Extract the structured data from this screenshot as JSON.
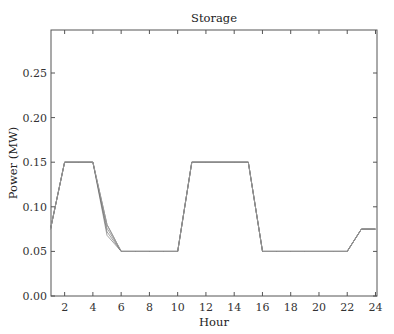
{
  "chart_data": {
    "type": "line",
    "title": "Storage",
    "xlabel": "Hour",
    "ylabel": "Power (MW)",
    "xlim": [
      1,
      24
    ],
    "ylim": [
      0,
      0.3
    ],
    "xticks": [
      2,
      4,
      6,
      8,
      10,
      12,
      14,
      16,
      18,
      20,
      22,
      24
    ],
    "yticks": [
      0.0,
      0.05,
      0.1,
      0.15,
      0.2,
      0.25
    ],
    "ytick_labels": [
      "0.00",
      "0.05",
      "0.10",
      "0.15",
      "0.20",
      "0.25"
    ],
    "grid": false,
    "legend": null,
    "x": [
      1,
      2,
      3,
      4,
      5,
      6,
      7,
      8,
      9,
      10,
      11,
      12,
      13,
      14,
      15,
      16,
      17,
      18,
      19,
      20,
      21,
      22,
      23,
      24
    ],
    "series": [
      {
        "name": "scenario 1",
        "values": [
          0.075,
          0.15,
          0.15,
          0.15,
          0.08,
          0.05,
          0.05,
          0.05,
          0.05,
          0.05,
          0.15,
          0.15,
          0.15,
          0.15,
          0.15,
          0.05,
          0.05,
          0.05,
          0.05,
          0.05,
          0.05,
          0.05,
          0.075,
          0.075
        ]
      },
      {
        "name": "scenario 2",
        "values": [
          0.075,
          0.15,
          0.15,
          0.15,
          0.076,
          0.05,
          0.05,
          0.05,
          0.05,
          0.05,
          0.15,
          0.15,
          0.15,
          0.15,
          0.15,
          0.05,
          0.05,
          0.05,
          0.05,
          0.05,
          0.05,
          0.05,
          0.075,
          0.075
        ]
      },
      {
        "name": "scenario 3",
        "values": [
          0.075,
          0.15,
          0.15,
          0.15,
          0.072,
          0.05,
          0.05,
          0.05,
          0.05,
          0.05,
          0.15,
          0.15,
          0.15,
          0.15,
          0.15,
          0.05,
          0.05,
          0.05,
          0.05,
          0.05,
          0.05,
          0.05,
          0.075,
          0.075
        ]
      },
      {
        "name": "scenario 4",
        "values": [
          0.075,
          0.15,
          0.15,
          0.15,
          0.068,
          0.05,
          0.05,
          0.05,
          0.05,
          0.05,
          0.15,
          0.15,
          0.15,
          0.15,
          0.15,
          0.05,
          0.05,
          0.05,
          0.05,
          0.05,
          0.05,
          0.05,
          0.075,
          0.075
        ]
      }
    ],
    "series_color": "#9a9a9a",
    "overlap_color": "#555555"
  }
}
